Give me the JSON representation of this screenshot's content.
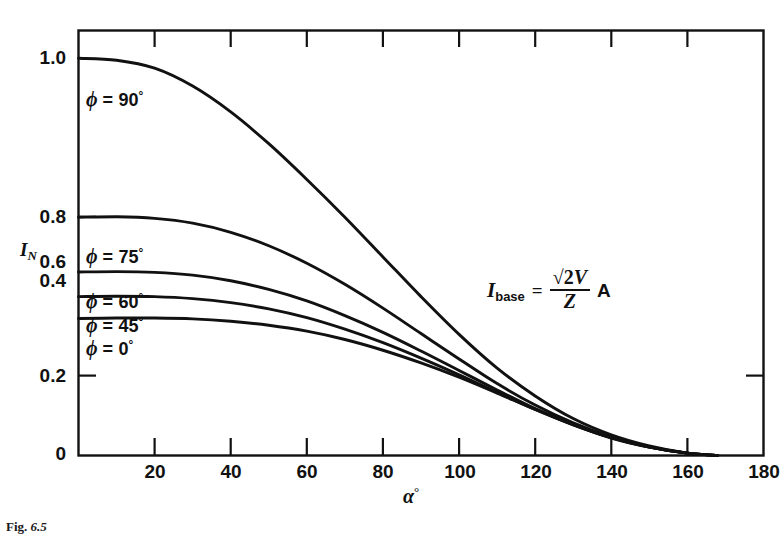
{
  "chart_data": {
    "type": "line",
    "title": "",
    "subtitle": "",
    "xlabel": "α°",
    "ylabel": "I_N",
    "xlim": [
      0,
      180
    ],
    "ylim": [
      0,
      1.07
    ],
    "grid": false,
    "legend": "inline-curve-labels",
    "xticks": [
      0,
      20,
      40,
      60,
      80,
      100,
      120,
      140,
      160,
      180
    ],
    "xtick_labels": [
      "0",
      "20",
      "40",
      "60",
      "80",
      "100",
      "120",
      "140",
      "160",
      "180"
    ],
    "yticks": [
      0,
      0.2,
      0.4,
      0.6,
      0.8,
      1.0
    ],
    "ytick_labels": [
      "0",
      "0.2",
      "0.4",
      "0.6",
      "0.8",
      "1.0"
    ],
    "annotations": [
      {
        "name": "base-current-formula",
        "text": "I_base = √2V / Z  A"
      }
    ],
    "series": [
      {
        "name": "φ = 90°",
        "label": "φ = 90°",
        "x": [
          0,
          10,
          20,
          30,
          40,
          50,
          60,
          70,
          80,
          90,
          100,
          110,
          120,
          130,
          140,
          150,
          160,
          168
        ],
        "values": [
          1.0,
          0.995,
          0.975,
          0.93,
          0.865,
          0.785,
          0.695,
          0.6,
          0.5,
          0.4,
          0.305,
          0.22,
          0.15,
          0.093,
          0.052,
          0.024,
          0.006,
          0.0
        ]
      },
      {
        "name": "φ = 75°",
        "label": "φ = 75°",
        "x": [
          0,
          10,
          20,
          30,
          40,
          50,
          60,
          70,
          80,
          90,
          100,
          110,
          120,
          130,
          140,
          150,
          160,
          168
        ],
        "values": [
          0.6,
          0.601,
          0.597,
          0.585,
          0.562,
          0.528,
          0.484,
          0.431,
          0.371,
          0.307,
          0.243,
          0.181,
          0.127,
          0.082,
          0.047,
          0.022,
          0.006,
          0.0
        ]
      },
      {
        "name": "φ = 60°",
        "label": "φ = 60°",
        "x": [
          0,
          10,
          20,
          30,
          40,
          50,
          60,
          70,
          80,
          90,
          100,
          110,
          120,
          130,
          140,
          150,
          160,
          168
        ],
        "values": [
          0.462,
          0.463,
          0.461,
          0.454,
          0.44,
          0.418,
          0.389,
          0.352,
          0.31,
          0.263,
          0.214,
          0.165,
          0.118,
          0.078,
          0.045,
          0.021,
          0.006,
          0.0
        ]
      },
      {
        "name": "φ = 45°",
        "label": "φ = 45°",
        "x": [
          0,
          10,
          20,
          30,
          40,
          50,
          60,
          70,
          80,
          90,
          100,
          110,
          120,
          130,
          140,
          150,
          160,
          168
        ],
        "values": [
          0.4,
          0.401,
          0.4,
          0.395,
          0.385,
          0.369,
          0.347,
          0.318,
          0.284,
          0.245,
          0.203,
          0.159,
          0.116,
          0.077,
          0.044,
          0.021,
          0.006,
          0.0
        ]
      },
      {
        "name": "φ = 0°",
        "label": "φ = 0°",
        "x": [
          0,
          10,
          20,
          30,
          40,
          50,
          60,
          70,
          80,
          90,
          100,
          110,
          120,
          130,
          140,
          150,
          160,
          168
        ],
        "values": [
          0.345,
          0.346,
          0.346,
          0.344,
          0.338,
          0.328,
          0.313,
          0.292,
          0.265,
          0.233,
          0.197,
          0.157,
          0.116,
          0.078,
          0.045,
          0.021,
          0.006,
          0.0
        ]
      }
    ]
  },
  "axes": {
    "y_title_main": "I",
    "y_title_sub": "N",
    "x_title_symbol": "α",
    "x_title_degree": "°"
  },
  "curve_labels": [
    {
      "phi": "ϕ",
      "eq": "=",
      "value": "90",
      "deg": "°"
    },
    {
      "phi": "ϕ",
      "eq": "=",
      "value": "75",
      "deg": "°"
    },
    {
      "phi": "ϕ",
      "eq": "=",
      "value": "60",
      "deg": "°"
    },
    {
      "phi": "ϕ",
      "eq": "=",
      "value": "45",
      "deg": "°"
    },
    {
      "phi": "ϕ",
      "eq": "=",
      "value": "0",
      "deg": "°"
    }
  ],
  "formula": {
    "symbol": "I",
    "subscript": "base",
    "equals": "=",
    "numerator_radical": "√2",
    "numerator_var": "V",
    "denominator": "Z",
    "unit": "A"
  },
  "caption": {
    "prefix": "Fig.",
    "number": "6.5"
  },
  "colors": {
    "curve": "#111111",
    "axis": "#111111",
    "background": "#ffffff",
    "text": "#111111"
  }
}
